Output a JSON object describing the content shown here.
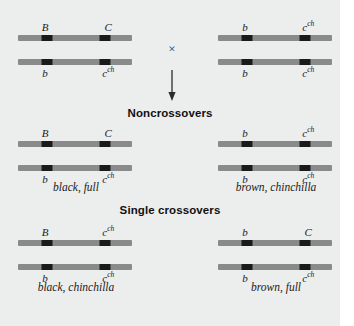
{
  "figure": {
    "cross_symbol": "×",
    "arrow": "down-arrow"
  },
  "parents": {
    "left": {
      "top_strand": {
        "gene1": "B",
        "gene2": "C",
        "gene2_sup": ""
      },
      "bottom_strand": {
        "gene1": "b",
        "gene2": "c",
        "gene2_sup": "ch"
      }
    },
    "right": {
      "top_strand": {
        "gene1": "b",
        "gene2": "c",
        "gene2_sup": "ch"
      },
      "bottom_strand": {
        "gene1": "b",
        "gene2": "c",
        "gene2_sup": "ch"
      }
    }
  },
  "sections": [
    {
      "heading": "Noncrossovers",
      "progeny": [
        {
          "top_strand": {
            "gene1": "B",
            "gene2": "C",
            "gene2_sup": ""
          },
          "bottom_strand": {
            "gene1": "b",
            "gene2": "c",
            "gene2_sup": "ch"
          },
          "phenotype": "black, full"
        },
        {
          "top_strand": {
            "gene1": "b",
            "gene2": "c",
            "gene2_sup": "ch"
          },
          "bottom_strand": {
            "gene1": "b",
            "gene2": "c",
            "gene2_sup": "ch"
          },
          "phenotype": "brown, chinchilla"
        }
      ]
    },
    {
      "heading": "Single crossovers",
      "progeny": [
        {
          "top_strand": {
            "gene1": "B",
            "gene2": "c",
            "gene2_sup": "ch"
          },
          "bottom_strand": {
            "gene1": "b",
            "gene2": "c",
            "gene2_sup": "ch"
          },
          "phenotype": "black, chinchilla"
        },
        {
          "top_strand": {
            "gene1": "b",
            "gene2": "C",
            "gene2_sup": ""
          },
          "bottom_strand": {
            "gene1": "b",
            "gene2": "c",
            "gene2_sup": "ch"
          },
          "phenotype": "brown, full"
        }
      ]
    }
  ],
  "colors": {
    "background": "#eceded",
    "chromosome": "#8a8a8a",
    "locus_band": "#1a1a1a",
    "text": "#1b1b1b"
  }
}
